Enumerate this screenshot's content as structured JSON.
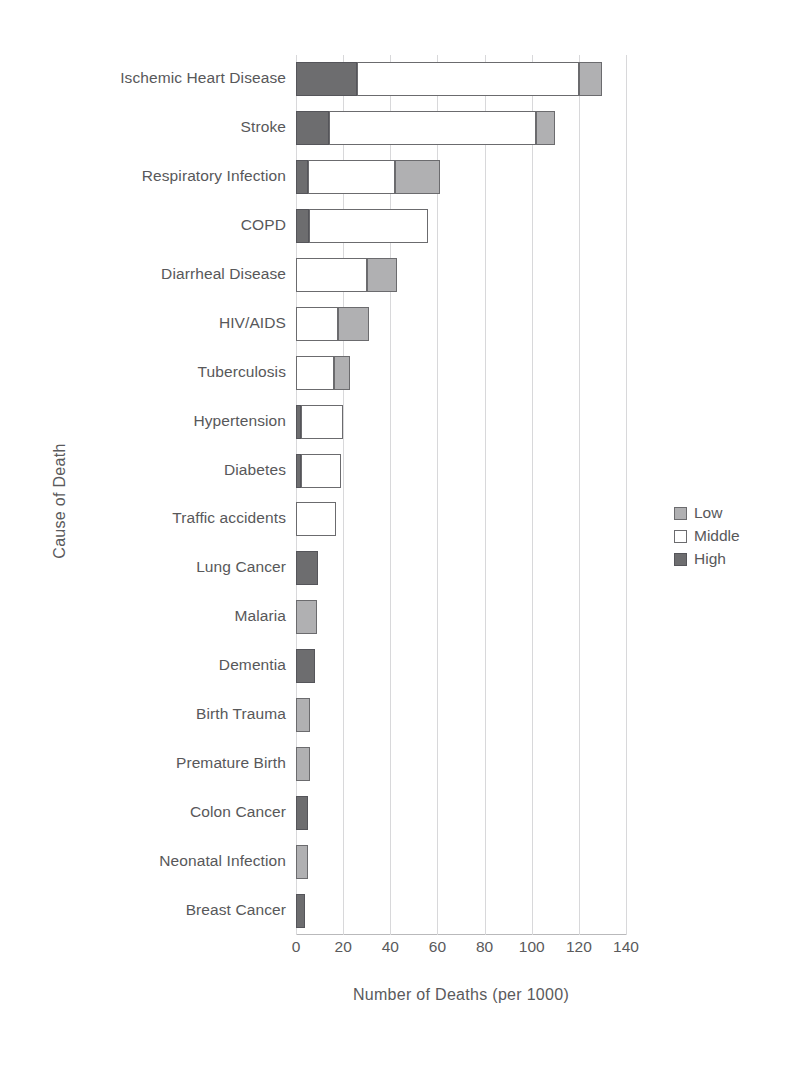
{
  "chart_data": {
    "type": "bar",
    "orientation": "horizontal",
    "stacked": true,
    "title": "",
    "xlabel": "Number of Deaths (per 1000)",
    "ylabel": "Cause of Death",
    "xlim": [
      0,
      140
    ],
    "xticks": [
      0,
      20,
      40,
      60,
      80,
      100,
      120,
      140
    ],
    "grid": true,
    "legend_position": "right",
    "categories": [
      "Ischemic Heart Disease",
      "Stroke",
      "Respiratory Infection",
      "COPD",
      "Diarrheal Disease",
      "HIV/AIDS",
      "Tuberculosis",
      "Hypertension",
      "Diabetes",
      "Traffic accidents",
      "Lung Cancer",
      "Malaria",
      "Dementia",
      "Birth Trauma",
      "Premature Birth",
      "Colon Cancer",
      "Neonatal Infection",
      "Breast Cancer"
    ],
    "series": [
      {
        "name": "High",
        "color": "#6d6d6f",
        "values": [
          26,
          14,
          5,
          5.5,
          0,
          0,
          0,
          2,
          2,
          0,
          9.5,
          0,
          8,
          0,
          0,
          5,
          0,
          4
        ]
      },
      {
        "name": "Middle",
        "color": "#ffffff",
        "values": [
          94,
          88,
          37,
          50.5,
          30,
          18,
          16,
          18,
          17,
          17,
          0,
          0,
          0,
          0,
          0,
          0,
          0,
          0
        ]
      },
      {
        "name": "Low",
        "color": "#b0b0b2",
        "values": [
          10,
          8,
          19,
          0,
          13,
          13,
          7,
          0,
          0,
          0,
          0,
          9,
          0,
          6,
          6,
          0,
          5,
          0
        ]
      }
    ],
    "totals": [
      130,
      110,
      61,
      56,
      43,
      31,
      23,
      20,
      19,
      17,
      9.5,
      9,
      8,
      6,
      6,
      5,
      5,
      4
    ]
  },
  "legend": {
    "items": [
      {
        "label": "Low",
        "swatch": "low-swatch"
      },
      {
        "label": "Middle",
        "swatch": "middle-swatch"
      },
      {
        "label": "High",
        "swatch": "high-swatch"
      }
    ]
  },
  "axes": {
    "x_title": "Number of Deaths (per 1000)",
    "y_title": "Cause of Death"
  },
  "colors": {
    "low": "#b0b0b2",
    "middle": "#ffffff",
    "high": "#6d6d6f",
    "text": "#58585a",
    "grid": "#d8d8da"
  }
}
